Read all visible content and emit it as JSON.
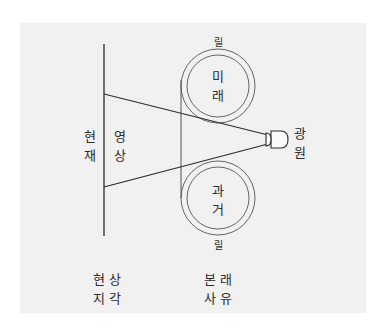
{
  "diagram": {
    "reels": {
      "top_label": "릴",
      "bottom_label": "릴",
      "future": {
        "line1": "미",
        "line2": "래"
      },
      "past": {
        "line1": "과",
        "line2": "거"
      }
    },
    "screen": {
      "line1": "현",
      "line2": "재"
    },
    "image": {
      "line1": "영",
      "line2": "상"
    },
    "light_source": {
      "line1": "광",
      "line2": "원"
    },
    "captions": {
      "left": {
        "line1": "현상",
        "line2": "지각"
      },
      "right": {
        "line1": "본래",
        "line2": "사유"
      }
    },
    "colors": {
      "panel": "#f1f1f1",
      "line": "#2a2a2a"
    }
  }
}
